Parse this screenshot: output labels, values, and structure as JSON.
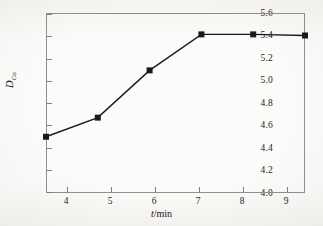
{
  "figure": {
    "background_color": "#fbfbf9",
    "frame_color": "#8e8e8e",
    "series_color": "#1a1a1a"
  },
  "axes": {
    "x": {
      "label_prefix": "t",
      "label_suffix": "/min",
      "ticks": [
        "4",
        "5",
        "6",
        "7",
        "8",
        "9"
      ],
      "min": 4,
      "max": 9
    },
    "y": {
      "label_symbol": "D",
      "label_subscript": "Co",
      "ticks": [
        "5.6",
        "5.4",
        "5.2",
        "5.0",
        "4.8",
        "4.6",
        "4.4",
        "4.2",
        "4.0"
      ],
      "min": 4.0,
      "max": 5.6
    }
  },
  "chart_data": {
    "type": "line",
    "title": "",
    "xlabel": "t/min",
    "ylabel": "D_Co",
    "x": [
      4,
      5,
      6,
      7,
      8,
      9
    ],
    "values": [
      4.5,
      4.67,
      5.09,
      5.41,
      5.41,
      5.4
    ],
    "series": [
      {
        "name": "D_Co",
        "marker": "filled-square",
        "values": [
          4.5,
          4.67,
          5.09,
          5.41,
          5.41,
          5.4
        ]
      }
    ],
    "xlim": [
      4,
      9
    ],
    "ylim": [
      4.0,
      5.6
    ],
    "xticks": [
      4,
      5,
      6,
      7,
      8,
      9
    ],
    "yticks": [
      4.0,
      4.2,
      4.4,
      4.6,
      4.8,
      5.0,
      5.2,
      5.4,
      5.6
    ],
    "grid": false,
    "legend": null
  }
}
